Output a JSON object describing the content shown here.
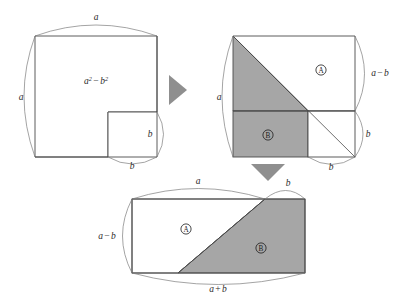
{
  "figure": {
    "identity": "a^2 - b^2 = (a+b)(a-b)",
    "colors": {
      "stroke": "#4a4a4a",
      "arc": "#6e6e6e",
      "gray_fill": "#a6a6a6",
      "white_fill": "#ffffff",
      "arrow": "#8c8c8c",
      "text": "#2b2b2b",
      "background": "#ffffff"
    }
  },
  "panel1": {
    "name": "notched-square",
    "area_label": {
      "base": "a",
      "exponent": "2",
      "operator": "−",
      "base2": "b",
      "exponent2": "2",
      "full": "a² − b²"
    },
    "top_arc_label": "a",
    "left_arc_label": "a",
    "cutout_right_arc_label": "b",
    "cutout_bottom_arc_label": "b"
  },
  "arrow_right": {
    "name": "transform-arrow-right",
    "direction": "right"
  },
  "arrow_down": {
    "name": "transform-arrow-down",
    "direction": "down"
  },
  "panel2": {
    "name": "split-square",
    "left_arc_label": "a",
    "right_upper_arc_label": {
      "first": "a",
      "operator": "−",
      "second": "b",
      "full": "a − b"
    },
    "right_lower_arc_label": "b",
    "bottom_arc_label": "b",
    "region_a_label": "A",
    "region_b_label": "B"
  },
  "panel3": {
    "name": "assembled-rectangle",
    "top_arc_left_label": "a",
    "top_arc_right_label": "b",
    "left_arc_label": {
      "first": "a",
      "operator": "−",
      "second": "b",
      "full": "a − b"
    },
    "bottom_arc_label": {
      "first": "a",
      "operator": "+",
      "second": "b",
      "full": "a + b"
    },
    "region_a_label": "A",
    "region_b_label": "B"
  }
}
